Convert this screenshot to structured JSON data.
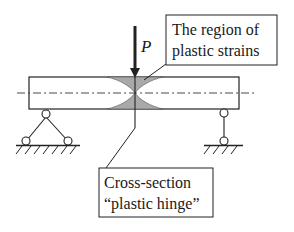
{
  "diagram": {
    "type": "beam-plastic-hinge",
    "load": {
      "label": "P",
      "direction": "down"
    },
    "labels": {
      "region_line1": "The region of",
      "region_line2": "plastic strains",
      "hinge_line1": "Cross-section",
      "hinge_line2": "“plastic hinge”"
    },
    "supports": {
      "left": "pinned-support",
      "right": "roller-support"
    },
    "colors": {
      "line": "#222222",
      "shaded_region": "#a9a9a9",
      "background": "#ffffff"
    }
  }
}
